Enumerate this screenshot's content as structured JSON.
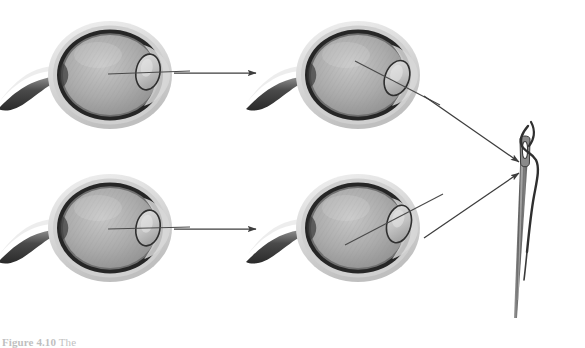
{
  "figure": {
    "domain": "anatomy-diagram",
    "background_color": "#ffffff",
    "caption": {
      "label": "Figure 4.10",
      "text": " The",
      "clipped": true,
      "color": "#2b2b2b"
    },
    "palette": {
      "sclera_outer": "#e6e6e6",
      "sclera_mid": "#bdbdbd",
      "choroid_dark": "#2e2e2e",
      "vitreous_light": "#b8b8b8",
      "vitreous_mid": "#9e9e9e",
      "lens_fill": "#cccccc",
      "lens_stroke": "#3a3a3a",
      "optic_nerve": "#555555",
      "line_stroke": "#4a4a4a",
      "needle_body": "#6e6e6e",
      "thread": "#3b3b3b"
    },
    "eyes": [
      {
        "id": "eye-top-left",
        "name": "eye-distant-unaccommodated",
        "cx": 110,
        "cy": 75,
        "rx": 62,
        "ry": 54,
        "lens": {
          "cx": 148,
          "cy": 72,
          "rx": 12,
          "ry": 18,
          "rotate": 10
        },
        "ray": {
          "type": "straight",
          "x1": 108,
          "y1": 75,
          "x2": 188,
          "y2": 72
        },
        "label": "Eye 1"
      },
      {
        "id": "eye-top-right",
        "name": "eye-distant-accommodated",
        "cx": 358,
        "cy": 75,
        "rx": 62,
        "ry": 54,
        "lens": {
          "cx": 396,
          "cy": 78,
          "rx": 12,
          "ry": 18,
          "rotate": 18
        },
        "ray": {
          "type": "diagonal",
          "x1": 360,
          "y1": 63,
          "x2": 437,
          "y2": 102
        },
        "label": "Eye 2"
      },
      {
        "id": "eye-bottom-left",
        "name": "eye-near-unaccommodated",
        "cx": 110,
        "cy": 228,
        "rx": 62,
        "ry": 54,
        "lens": {
          "cx": 148,
          "cy": 228,
          "rx": 12,
          "ry": 18,
          "rotate": 10
        },
        "ray": {
          "type": "straight",
          "x1": 108,
          "y1": 229,
          "x2": 188,
          "y2": 227
        },
        "label": "Eye 3"
      },
      {
        "id": "eye-bottom-right",
        "name": "eye-near-accommodated",
        "cx": 358,
        "cy": 228,
        "rx": 62,
        "ry": 54,
        "lens": {
          "cx": 398,
          "cy": 224,
          "rx": 12,
          "ry": 19,
          "rotate": 14
        },
        "ray": {
          "type": "diagonal",
          "x1": 348,
          "y1": 243,
          "x2": 440,
          "y2": 196
        },
        "label": "Eye 4"
      }
    ],
    "arrows": [
      {
        "id": "arrow-top-horizontal",
        "name": "arrow-top-left-to-top-right",
        "from": "eye-top-left",
        "to": "eye-top-right",
        "x1": 172,
        "y1": 73,
        "x2": 255,
        "y2": 73
      },
      {
        "id": "arrow-bottom-horizontal",
        "name": "arrow-bottom-left-to-bottom-right",
        "from": "eye-bottom-left",
        "to": "eye-bottom-right",
        "x1": 172,
        "y1": 229,
        "x2": 255,
        "y2": 229
      },
      {
        "id": "arrow-top-to-needle",
        "name": "arrow-top-right-to-needle",
        "from": "eye-top-right",
        "to": "needle",
        "x1": 424,
        "y1": 96,
        "x2": 521,
        "y2": 163
      },
      {
        "id": "arrow-bottom-to-needle",
        "name": "arrow-bottom-right-to-needle",
        "from": "eye-bottom-right",
        "to": "needle",
        "x1": 424,
        "y1": 238,
        "x2": 521,
        "y2": 172
      }
    ],
    "needle": {
      "id": "needle",
      "name": "threaded-needle",
      "tip_x": 525,
      "tip_y": 135,
      "base_x": 512,
      "base_y": 318,
      "eye_cx": 524,
      "eye_cy": 160,
      "description": "Sewing needle with thread passing through its eye"
    }
  }
}
